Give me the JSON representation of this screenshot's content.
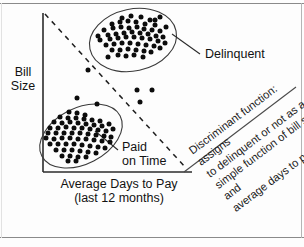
{
  "figure": {
    "kind": "scatter-plot-diagram",
    "background_color": "#fdfdfd",
    "frame_color": "#8a8a8a",
    "ink_color": "#121212"
  },
  "axes": {
    "y_label": "Bill\nSize",
    "x_label": "Average Days to Pay\n(last 12 months)",
    "y_label_line1": "Bill",
    "y_label_line2": "Size",
    "x_label_line1": "Average Days to Pay",
    "x_label_line2": "(last 12 months)",
    "axis_color": "#2b2b2b"
  },
  "cluster_labels": {
    "delinquent": "Delinquent",
    "paid_on_time": "Paid\non Time",
    "paid_on_time_line1": "Paid",
    "paid_on_time_line2": "on Time"
  },
  "annotation": {
    "text": "Discriminant function: assigns\nto delinquent or not as a\nsimple function of bill size and\naverage days to pay.",
    "rotation_deg": -37
  },
  "chart_data": {
    "type": "scatter",
    "title": "",
    "xlabel": "Average Days to Pay (last 12 months)",
    "ylabel": "Bill Size",
    "xlim": [
      0,
      100
    ],
    "ylim": [
      0,
      100
    ],
    "grid": false,
    "legend": "inline-annotations",
    "series": [
      {
        "name": "Delinquent",
        "marker": "filled-circle",
        "color": "#0c0c0c",
        "ellipse": {
          "cx": 133,
          "cy": 40,
          "rx": 44,
          "ry": 31,
          "rotate": -12
        },
        "points": [
          [
            122,
            18
          ],
          [
            131,
            16
          ],
          [
            141,
            17
          ],
          [
            150,
            20
          ],
          [
            112,
            24
          ],
          [
            120,
            22
          ],
          [
            128,
            21
          ],
          [
            136,
            22
          ],
          [
            145,
            24
          ],
          [
            155,
            25
          ],
          [
            104,
            30
          ],
          [
            113,
            28
          ],
          [
            121,
            27
          ],
          [
            129,
            28
          ],
          [
            137,
            27
          ],
          [
            144,
            29
          ],
          [
            152,
            30
          ],
          [
            160,
            31
          ],
          [
            166,
            27
          ],
          [
            108,
            35
          ],
          [
            116,
            34
          ],
          [
            124,
            33
          ],
          [
            132,
            32
          ],
          [
            140,
            33
          ],
          [
            148,
            34
          ],
          [
            156,
            36
          ],
          [
            163,
            37
          ],
          [
            100,
            40
          ],
          [
            110,
            39
          ],
          [
            118,
            38
          ],
          [
            126,
            37
          ],
          [
            134,
            37
          ],
          [
            142,
            38
          ],
          [
            150,
            39
          ],
          [
            158,
            41
          ],
          [
            165,
            43
          ],
          [
            106,
            45
          ],
          [
            114,
            44
          ],
          [
            122,
            43
          ],
          [
            130,
            43
          ],
          [
            138,
            44
          ],
          [
            146,
            45
          ],
          [
            154,
            46
          ],
          [
            160,
            48
          ],
          [
            112,
            50
          ],
          [
            120,
            50
          ],
          [
            128,
            49
          ],
          [
            136,
            50
          ],
          [
            144,
            51
          ],
          [
            151,
            52
          ],
          [
            118,
            55
          ],
          [
            126,
            56
          ],
          [
            134,
            55
          ],
          [
            143,
            57
          ],
          [
            108,
            57
          ],
          [
            155,
            20
          ],
          [
            160,
            17
          ],
          [
            98,
            36
          ]
        ]
      },
      {
        "name": "Paid on Time",
        "marker": "filled-circle",
        "color": "#0c0c0c",
        "ellipse": {
          "cx": 81,
          "cy": 136,
          "rx": 44,
          "ry": 28,
          "rotate": -27
        },
        "points": [
          [
            69,
            112
          ],
          [
            77,
            113
          ],
          [
            85,
            115
          ],
          [
            60,
            117
          ],
          [
            68,
            118
          ],
          [
            76,
            118
          ],
          [
            84,
            119
          ],
          [
            92,
            120
          ],
          [
            100,
            121
          ],
          [
            54,
            122
          ],
          [
            62,
            123
          ],
          [
            70,
            122
          ],
          [
            78,
            123
          ],
          [
            86,
            124
          ],
          [
            94,
            125
          ],
          [
            102,
            126
          ],
          [
            109,
            124
          ],
          [
            50,
            128
          ],
          [
            58,
            128
          ],
          [
            66,
            127
          ],
          [
            74,
            128
          ],
          [
            82,
            128
          ],
          [
            90,
            129
          ],
          [
            98,
            130
          ],
          [
            106,
            131
          ],
          [
            113,
            129
          ],
          [
            48,
            133
          ],
          [
            56,
            133
          ],
          [
            64,
            133
          ],
          [
            72,
            133
          ],
          [
            80,
            133
          ],
          [
            88,
            134
          ],
          [
            96,
            135
          ],
          [
            104,
            136
          ],
          [
            111,
            137
          ],
          [
            46,
            138
          ],
          [
            54,
            139
          ],
          [
            62,
            138
          ],
          [
            70,
            138
          ],
          [
            78,
            139
          ],
          [
            86,
            139
          ],
          [
            94,
            140
          ],
          [
            102,
            141
          ],
          [
            110,
            142
          ],
          [
            50,
            144
          ],
          [
            58,
            144
          ],
          [
            66,
            144
          ],
          [
            74,
            144
          ],
          [
            82,
            145
          ],
          [
            90,
            146
          ],
          [
            98,
            147
          ],
          [
            105,
            148
          ],
          [
            56,
            150
          ],
          [
            64,
            150
          ],
          [
            72,
            150
          ],
          [
            80,
            151
          ],
          [
            88,
            152
          ],
          [
            96,
            153
          ],
          [
            62,
            156
          ],
          [
            70,
            156
          ],
          [
            78,
            157
          ],
          [
            86,
            157
          ],
          [
            68,
            161
          ],
          [
            76,
            161
          ]
        ]
      },
      {
        "name": "Outliers",
        "marker": "filled-circle",
        "color": "#0c0c0c",
        "points": [
          [
            88,
            70
          ],
          [
            77,
            98
          ],
          [
            137,
            90
          ],
          [
            152,
            90
          ],
          [
            140,
            102
          ],
          [
            97,
            104
          ]
        ]
      }
    ],
    "discriminant_line": {
      "style": "dashed",
      "from": [
        45,
        14
      ],
      "to": [
        186,
        168
      ],
      "color": "#1f1f1f"
    },
    "annotations": [
      {
        "text": "Delinquent",
        "at": [
          205,
          53
        ],
        "leader_to": [
          172,
          33
        ]
      },
      {
        "text": "Paid on Time",
        "at": [
          122,
          146
        ],
        "leader_to": [
          95,
          130
        ]
      },
      {
        "text": "Discriminant function: assigns to delinquent or not as a simple function of bill size and average days to pay.",
        "rotated": true
      }
    ]
  }
}
